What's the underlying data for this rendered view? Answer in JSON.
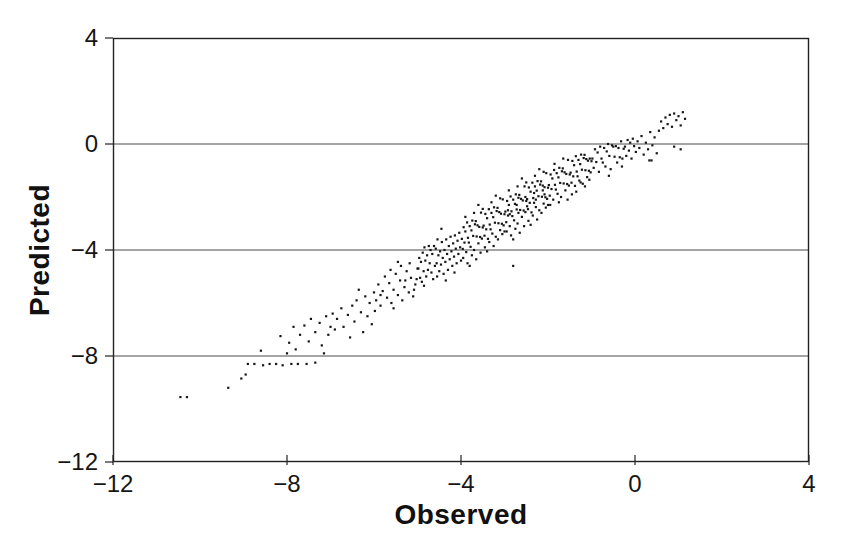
{
  "figure": {
    "background": "#ffffff",
    "ink_color": "#161616",
    "gridline_color": "#4a4a4a",
    "border_color": "#222222"
  },
  "chart_data": {
    "type": "scatter",
    "title": "",
    "xlabel": "Observed",
    "ylabel": "Predicted",
    "xlim": [
      -12,
      4
    ],
    "ylim": [
      -12,
      4
    ],
    "xticks": [
      -12,
      -8,
      -4,
      0,
      4
    ],
    "yticks": [
      4,
      0,
      -4,
      -8,
      -12
    ],
    "xtick_labels": [
      "−12",
      "−8",
      "−4",
      "0",
      "4"
    ],
    "ytick_labels": [
      "4",
      "0",
      "−4",
      "−8",
      "−12"
    ],
    "horizontal_gridlines_at_y": [
      0,
      -4,
      -8
    ],
    "grid": "horizontal-only",
    "legend": "none",
    "marker": {
      "shape": "point",
      "color": "#161616",
      "size_px": 2.2
    },
    "n_points": 409,
    "points": [
      [
        -10.45,
        -9.55
      ],
      [
        -10.3,
        -9.55
      ],
      [
        -9.35,
        -9.2
      ],
      [
        -9.05,
        -8.85
      ],
      [
        -8.9,
        -8.3
      ],
      [
        -8.75,
        -8.3
      ],
      [
        -8.55,
        -8.35
      ],
      [
        -8.4,
        -8.3
      ],
      [
        -8.25,
        -8.3
      ],
      [
        -8.1,
        -8.35
      ],
      [
        -7.9,
        -8.3
      ],
      [
        -7.75,
        -8.3
      ],
      [
        -7.55,
        -8.3
      ],
      [
        -7.35,
        -8.25
      ],
      [
        -8.6,
        -7.8
      ],
      [
        -8.15,
        -7.25
      ],
      [
        -8.95,
        -8.7
      ],
      [
        -8.0,
        -7.9
      ],
      [
        -7.95,
        -7.5
      ],
      [
        -7.85,
        -6.9
      ],
      [
        -7.8,
        -7.75
      ],
      [
        -7.7,
        -7.2
      ],
      [
        -7.6,
        -6.85
      ],
      [
        -7.5,
        -7.45
      ],
      [
        -7.45,
        -6.6
      ],
      [
        -7.35,
        -7.1
      ],
      [
        -7.25,
        -6.75
      ],
      [
        -7.2,
        -7.6
      ],
      [
        -7.1,
        -6.5
      ],
      [
        -7.05,
        -7.2
      ],
      [
        -7.0,
        -6.9
      ],
      [
        -7.15,
        -7.9
      ],
      [
        -6.95,
        -6.4
      ],
      [
        -6.9,
        -7.0
      ],
      [
        -6.85,
        -6.6
      ],
      [
        -6.75,
        -6.2
      ],
      [
        -6.7,
        -6.9
      ],
      [
        -6.6,
        -6.45
      ],
      [
        -6.55,
        -7.3
      ],
      [
        -6.5,
        -6.1
      ],
      [
        -6.45,
        -6.7
      ],
      [
        -6.4,
        -5.9
      ],
      [
        -6.3,
        -6.35
      ],
      [
        -6.25,
        -7.1
      ],
      [
        -6.2,
        -5.75
      ],
      [
        -6.15,
        -6.5
      ],
      [
        -6.1,
        -6.0
      ],
      [
        -6.05,
        -6.8
      ],
      [
        -6.0,
        -5.6
      ],
      [
        -6.35,
        -5.5
      ],
      [
        -5.95,
        -5.9
      ],
      [
        -5.9,
        -5.3
      ],
      [
        -5.85,
        -6.1
      ],
      [
        -5.8,
        -5.55
      ],
      [
        -5.75,
        -5.0
      ],
      [
        -5.7,
        -5.8
      ],
      [
        -5.65,
        -5.25
      ],
      [
        -5.6,
        -6.0
      ],
      [
        -5.55,
        -5.5
      ],
      [
        -5.5,
        -4.9
      ],
      [
        -5.45,
        -5.7
      ],
      [
        -5.4,
        -5.15
      ],
      [
        -5.35,
        -5.9
      ],
      [
        -5.3,
        -5.4
      ],
      [
        -5.25,
        -4.8
      ],
      [
        -5.2,
        -5.6
      ],
      [
        -5.15,
        -5.05
      ],
      [
        -5.1,
        -5.75
      ],
      [
        -5.05,
        -5.3
      ],
      [
        -5.0,
        -4.7
      ],
      [
        -5.98,
        -6.3
      ],
      [
        -5.62,
        -4.75
      ],
      [
        -5.38,
        -4.6
      ],
      [
        -5.18,
        -4.5
      ],
      [
        -5.08,
        -5.5
      ],
      [
        -5.85,
        -5.7
      ],
      [
        -5.55,
        -6.2
      ],
      [
        -5.28,
        -5.15
      ],
      [
        -5.45,
        -4.45
      ],
      [
        -5.02,
        -5.1
      ],
      [
        -4.98,
        -4.7
      ],
      [
        -4.96,
        -4.3
      ],
      [
        -4.94,
        -5.05
      ],
      [
        -4.92,
        -4.45
      ],
      [
        -4.9,
        -5.2
      ],
      [
        -4.88,
        -4.1
      ],
      [
        -4.86,
        -4.8
      ],
      [
        -4.84,
        -3.9
      ],
      [
        -4.82,
        -4.4
      ],
      [
        -4.8,
        -5.0
      ],
      [
        -4.78,
        -4.2
      ],
      [
        -4.76,
        -4.75
      ],
      [
        -4.74,
        -3.85
      ],
      [
        -4.72,
        -4.5
      ],
      [
        -4.7,
        -4.0
      ],
      [
        -4.68,
        -4.85
      ],
      [
        -4.66,
        -4.15
      ],
      [
        -4.64,
        -5.1
      ],
      [
        -4.62,
        -3.85
      ],
      [
        -4.6,
        -4.6
      ],
      [
        -4.58,
        -3.95
      ],
      [
        -4.56,
        -4.5
      ],
      [
        -4.54,
        -3.6
      ],
      [
        -4.52,
        -4.2
      ],
      [
        -4.5,
        -4.8
      ],
      [
        -4.48,
        -4.05
      ],
      [
        -4.46,
        -4.55
      ],
      [
        -4.44,
        -3.7
      ],
      [
        -4.42,
        -4.3
      ],
      [
        -4.4,
        -4.9
      ],
      [
        -4.38,
        -4.0
      ],
      [
        -4.36,
        -4.45
      ],
      [
        -4.34,
        -3.6
      ],
      [
        -4.32,
        -4.15
      ],
      [
        -4.3,
        -4.75
      ],
      [
        -4.28,
        -3.85
      ],
      [
        -4.26,
        -4.35
      ],
      [
        -4.24,
        -3.5
      ],
      [
        -4.22,
        -4.05
      ],
      [
        -4.2,
        -4.6
      ],
      [
        -4.18,
        -3.75
      ],
      [
        -4.16,
        -4.25
      ],
      [
        -4.14,
        -3.45
      ],
      [
        -4.12,
        -3.95
      ],
      [
        -4.1,
        -4.5
      ],
      [
        -4.08,
        -3.65
      ],
      [
        -4.06,
        -4.15
      ],
      [
        -4.04,
        -3.35
      ],
      [
        -4.02,
        -3.9
      ],
      [
        -4.0,
        -4.4
      ],
      [
        -4.85,
        -5.35
      ],
      [
        -4.55,
        -5.0
      ],
      [
        -4.35,
        -5.15
      ],
      [
        -4.15,
        -4.85
      ],
      [
        -4.45,
        -3.2
      ],
      [
        -3.98,
        -3.58
      ],
      [
        -3.96,
        -3.96
      ],
      [
        -3.94,
        -3.14
      ],
      [
        -3.92,
        -3.72
      ],
      [
        -3.9,
        -3.3
      ],
      [
        -3.88,
        -4.08
      ],
      [
        -3.86,
        -2.96
      ],
      [
        -3.84,
        -3.54
      ],
      [
        -3.82,
        -3.72
      ],
      [
        -3.8,
        -3.1
      ],
      [
        -3.78,
        -3.88
      ],
      [
        -3.76,
        -3.26
      ],
      [
        -3.74,
        -2.89
      ],
      [
        -3.72,
        -3.47
      ],
      [
        -3.7,
        -4.0
      ],
      [
        -3.68,
        -3.03
      ],
      [
        -3.66,
        -2.91
      ],
      [
        -3.64,
        -3.49
      ],
      [
        -3.62,
        -3.07
      ],
      [
        -3.6,
        -3.75
      ],
      [
        -3.58,
        -3.13
      ],
      [
        -3.56,
        -3.51
      ],
      [
        -3.54,
        -2.59
      ],
      [
        -3.52,
        -3.57
      ],
      [
        -3.5,
        -3.15
      ],
      [
        -3.48,
        -3.08
      ],
      [
        -3.46,
        -3.46
      ],
      [
        -3.44,
        -2.64
      ],
      [
        -3.42,
        -3.22
      ],
      [
        -3.4,
        -2.8
      ],
      [
        -3.38,
        -3.58
      ],
      [
        -3.36,
        -2.46
      ],
      [
        -3.34,
        -3.04
      ],
      [
        -3.32,
        -3.22
      ],
      [
        -3.3,
        -2.6
      ],
      [
        -3.28,
        -3.38
      ],
      [
        -3.26,
        -2.76
      ],
      [
        -3.24,
        -2.39
      ],
      [
        -3.22,
        -2.97
      ],
      [
        -3.2,
        -3.5
      ],
      [
        -3.18,
        -2.53
      ],
      [
        -3.16,
        -2.41
      ],
      [
        -3.14,
        -2.99
      ],
      [
        -3.12,
        -2.57
      ],
      [
        -3.1,
        -3.25
      ],
      [
        -3.08,
        -2.63
      ],
      [
        -3.06,
        -3.01
      ],
      [
        -3.04,
        -2.09
      ],
      [
        -3.02,
        -3.07
      ],
      [
        -3.0,
        -2.65
      ],
      [
        -3.95,
        -4.3
      ],
      [
        -3.85,
        -4.5
      ],
      [
        -3.75,
        -4.2
      ],
      [
        -3.65,
        -4.35
      ],
      [
        -3.55,
        -4.1
      ],
      [
        -3.45,
        -3.9
      ],
      [
        -3.35,
        -3.7
      ],
      [
        -3.25,
        -3.85
      ],
      [
        -3.15,
        -3.6
      ],
      [
        -3.05,
        -3.4
      ],
      [
        -3.9,
        -2.75
      ],
      [
        -3.7,
        -2.6
      ],
      [
        -3.5,
        -2.45
      ],
      [
        -3.3,
        -2.2
      ],
      [
        -3.1,
        -2.05
      ],
      [
        -3.8,
        -4.6
      ],
      [
        -3.6,
        -2.3
      ],
      [
        -3.4,
        -4.05
      ],
      [
        -3.2,
        -1.95
      ],
      [
        -3.0,
        -3.3
      ],
      [
        -2.98,
        -2.55
      ],
      [
        -2.96,
        -2.95
      ],
      [
        -2.94,
        -2.15
      ],
      [
        -2.92,
        -2.7
      ],
      [
        -2.9,
        -2.3
      ],
      [
        -2.88,
        -3.1
      ],
      [
        -2.86,
        -1.98
      ],
      [
        -2.84,
        -2.54
      ],
      [
        -2.82,
        -2.72
      ],
      [
        -2.8,
        -2.1
      ],
      [
        -2.78,
        -2.88
      ],
      [
        -2.76,
        -2.26
      ],
      [
        -2.74,
        -1.9
      ],
      [
        -2.72,
        -2.47
      ],
      [
        -2.7,
        -3.0
      ],
      [
        -2.68,
        -2.03
      ],
      [
        -2.66,
        -1.92
      ],
      [
        -2.64,
        -2.49
      ],
      [
        -2.62,
        -2.07
      ],
      [
        -2.6,
        -2.75
      ],
      [
        -2.58,
        -2.13
      ],
      [
        -2.56,
        -2.51
      ],
      [
        -2.54,
        -1.6
      ],
      [
        -2.52,
        -2.57
      ],
      [
        -2.5,
        -2.15
      ],
      [
        -2.48,
        -2.08
      ],
      [
        -2.46,
        -2.46
      ],
      [
        -2.44,
        -1.64
      ],
      [
        -2.42,
        -2.22
      ],
      [
        -2.4,
        -1.8
      ],
      [
        -2.38,
        -2.58
      ],
      [
        -2.36,
        -1.46
      ],
      [
        -2.34,
        -2.04
      ],
      [
        -2.32,
        -2.22
      ],
      [
        -2.3,
        -1.6
      ],
      [
        -2.28,
        -2.38
      ],
      [
        -2.26,
        -1.76
      ],
      [
        -2.24,
        -1.4
      ],
      [
        -2.22,
        -1.97
      ],
      [
        -2.2,
        -2.5
      ],
      [
        -2.18,
        -1.53
      ],
      [
        -2.16,
        -1.41
      ],
      [
        -2.14,
        -1.99
      ],
      [
        -2.12,
        -1.57
      ],
      [
        -2.1,
        -2.25
      ],
      [
        -2.08,
        -1.63
      ],
      [
        -2.06,
        -2.01
      ],
      [
        -2.04,
        -1.1
      ],
      [
        -2.02,
        -2.07
      ],
      [
        -2.0,
        -1.65
      ],
      [
        -2.95,
        -3.3
      ],
      [
        -2.85,
        -3.45
      ],
      [
        -2.75,
        -3.2
      ],
      [
        -2.65,
        -3.35
      ],
      [
        -2.55,
        -3.1
      ],
      [
        -2.45,
        -2.9
      ],
      [
        -2.35,
        -2.7
      ],
      [
        -2.25,
        -2.85
      ],
      [
        -2.15,
        -2.6
      ],
      [
        -2.05,
        -2.4
      ],
      [
        -2.9,
        -1.75
      ],
      [
        -2.7,
        -1.6
      ],
      [
        -2.5,
        -1.45
      ],
      [
        -2.3,
        -1.2
      ],
      [
        -2.1,
        -1.05
      ],
      [
        -2.8,
        -3.6
      ],
      [
        -2.6,
        -1.3
      ],
      [
        -2.4,
        -3.05
      ],
      [
        -2.2,
        -0.95
      ],
      [
        -2.0,
        -2.3
      ],
      [
        -2.92,
        -2.5
      ],
      [
        -2.72,
        -2.3
      ],
      [
        -2.52,
        -2.0
      ],
      [
        -2.32,
        -1.85
      ],
      [
        -2.12,
        -1.75
      ],
      [
        -2.88,
        -2.65
      ],
      [
        -2.68,
        -2.6
      ],
      [
        -2.48,
        -2.35
      ],
      [
        -2.28,
        -2.1
      ],
      [
        -2.08,
        -1.9
      ],
      [
        -1.98,
        -1.55
      ],
      [
        -1.96,
        -1.95
      ],
      [
        -1.94,
        -1.15
      ],
      [
        -1.92,
        -1.7
      ],
      [
        -1.9,
        -1.3
      ],
      [
        -1.88,
        -2.1
      ],
      [
        -1.86,
        -0.98
      ],
      [
        -1.84,
        -1.54
      ],
      [
        -1.82,
        -1.72
      ],
      [
        -1.8,
        -1.1
      ],
      [
        -1.78,
        -1.88
      ],
      [
        -1.76,
        -1.26
      ],
      [
        -1.74,
        -0.9
      ],
      [
        -1.72,
        -1.47
      ],
      [
        -1.7,
        -2.0
      ],
      [
        -1.68,
        -1.03
      ],
      [
        -1.66,
        -0.92
      ],
      [
        -1.64,
        -1.49
      ],
      [
        -1.62,
        -1.07
      ],
      [
        -1.6,
        -1.75
      ],
      [
        -1.58,
        -1.13
      ],
      [
        -1.56,
        -1.51
      ],
      [
        -1.54,
        -0.6
      ],
      [
        -1.52,
        -1.57
      ],
      [
        -1.5,
        -1.15
      ],
      [
        -1.48,
        -1.08
      ],
      [
        -1.46,
        -1.46
      ],
      [
        -1.44,
        -0.64
      ],
      [
        -1.42,
        -1.22
      ],
      [
        -1.4,
        -0.8
      ],
      [
        -1.38,
        -1.58
      ],
      [
        -1.36,
        -0.46
      ],
      [
        -1.34,
        -1.04
      ],
      [
        -1.32,
        -1.22
      ],
      [
        -1.3,
        -0.6
      ],
      [
        -1.28,
        -1.38
      ],
      [
        -1.26,
        -0.76
      ],
      [
        -1.24,
        -0.4
      ],
      [
        -1.22,
        -0.97
      ],
      [
        -1.2,
        -1.5
      ],
      [
        -1.18,
        -0.53
      ],
      [
        -1.16,
        -0.41
      ],
      [
        -1.14,
        -0.99
      ],
      [
        -1.12,
        -0.57
      ],
      [
        -1.1,
        -1.25
      ],
      [
        -1.08,
        -0.63
      ],
      [
        -1.06,
        -1.01
      ],
      [
        -1.04,
        -0.55
      ],
      [
        -1.02,
        -1.07
      ],
      [
        -1.0,
        -0.65
      ],
      [
        -1.95,
        -2.3
      ],
      [
        -1.75,
        -2.2
      ],
      [
        -1.55,
        -2.1
      ],
      [
        -1.35,
        -1.8
      ],
      [
        -1.15,
        -1.6
      ],
      [
        -1.85,
        -0.75
      ],
      [
        -1.65,
        -0.55
      ],
      [
        -1.45,
        -1.9
      ],
      [
        -1.25,
        -1.45
      ],
      [
        -1.05,
        -1.35
      ],
      [
        -0.98,
        -0.55
      ],
      [
        -0.95,
        -0.9
      ],
      [
        -0.92,
        -0.2
      ],
      [
        -0.89,
        -0.68
      ],
      [
        -0.86,
        -0.32
      ],
      [
        -0.83,
        -1.05
      ],
      [
        -0.8,
        -0.1
      ],
      [
        -0.77,
        -0.55
      ],
      [
        -0.74,
        -0.7
      ],
      [
        -0.71,
        -0.15
      ],
      [
        -0.68,
        -0.85
      ],
      [
        -0.65,
        -0.28
      ],
      [
        -0.62,
        0.0
      ],
      [
        -0.59,
        -0.45
      ],
      [
        -0.56,
        -0.95
      ],
      [
        -0.53,
        -0.05
      ],
      [
        -0.5,
        -0.1
      ],
      [
        -0.47,
        -0.48
      ],
      [
        -0.44,
        -0.08
      ],
      [
        -0.41,
        -0.7
      ],
      [
        -0.38,
        -0.15
      ],
      [
        -0.35,
        -0.5
      ],
      [
        -0.32,
        0.1
      ],
      [
        -0.29,
        -0.55
      ],
      [
        -0.26,
        -0.18
      ],
      [
        -0.23,
        -0.1
      ],
      [
        -0.2,
        -0.45
      ],
      [
        -0.17,
        0.15
      ],
      [
        -0.14,
        -0.25
      ],
      [
        -0.11,
        0.05
      ],
      [
        -0.08,
        -0.55
      ],
      [
        -0.05,
        0.2
      ],
      [
        -0.02,
        -0.08
      ],
      [
        -0.6,
        -1.2
      ],
      [
        -0.3,
        -0.85
      ],
      [
        0.02,
        -0.3
      ],
      [
        0.06,
        0.1
      ],
      [
        0.1,
        -0.15
      ],
      [
        0.15,
        0.3
      ],
      [
        0.2,
        -0.4
      ],
      [
        0.25,
        0.05
      ],
      [
        0.3,
        -0.2
      ],
      [
        0.35,
        0.45
      ],
      [
        0.4,
        -0.05
      ],
      [
        0.45,
        0.25
      ],
      [
        0.5,
        -0.35
      ],
      [
        0.55,
        0.5
      ],
      [
        0.6,
        0.85
      ],
      [
        0.65,
        0.6
      ],
      [
        0.7,
        1.0
      ],
      [
        0.75,
        0.75
      ],
      [
        0.8,
        1.1
      ],
      [
        0.85,
        0.65
      ],
      [
        0.9,
        1.15
      ],
      [
        0.95,
        0.9
      ],
      [
        1.0,
        1.05
      ],
      [
        1.05,
        0.7
      ],
      [
        1.1,
        1.2
      ],
      [
        1.15,
        0.95
      ],
      [
        0.9,
        -0.1
      ],
      [
        1.05,
        -0.2
      ],
      [
        0.33,
        -0.62
      ],
      [
        0.38,
        -0.62
      ],
      [
        -2.8,
        -4.6
      ]
    ]
  }
}
